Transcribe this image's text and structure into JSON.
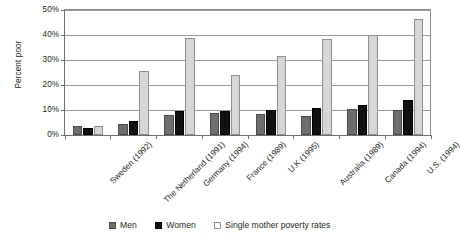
{
  "chart_data": {
    "type": "bar",
    "title": "",
    "xlabel": "",
    "ylabel": "Percent poor",
    "ylim": [
      0,
      50
    ],
    "ytick_labels": [
      "50%",
      "40%",
      "30%",
      "20%",
      "10%",
      "0%"
    ],
    "ytick_values": [
      50,
      40,
      30,
      20,
      10,
      0
    ],
    "grid": true,
    "legend_position": "bottom",
    "categories": [
      "Sweden (1992)",
      "The Netherland (1991)",
      "Germany (1994)",
      "France (1989)",
      "U.K (1995)",
      "Australia (1989)",
      "Canada (1994)",
      "U.S. (1994)"
    ],
    "series": [
      {
        "name": "Men",
        "color": "#6e6e6e",
        "values": [
          3.5,
          4.5,
          8.0,
          9.0,
          8.5,
          7.5,
          10.5,
          10.0
        ]
      },
      {
        "name": "Women",
        "color": "#111111",
        "values": [
          3.0,
          5.5,
          9.5,
          9.5,
          10.0,
          11.0,
          12.0,
          14.0
        ]
      },
      {
        "name": "Single mother poverty rates",
        "color": "#d6d6d6",
        "values": [
          3.5,
          25.5,
          39.0,
          24.0,
          31.5,
          38.5,
          40.0,
          46.5
        ]
      }
    ]
  },
  "legend": {
    "items": [
      {
        "label": "Men"
      },
      {
        "label": "Women"
      },
      {
        "label": "Single mother poverty rates"
      }
    ]
  }
}
